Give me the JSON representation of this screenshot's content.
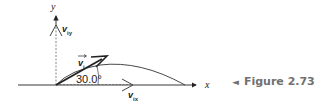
{
  "figure": {
    "caption_marker": "◄",
    "caption": "Figure 2.73"
  },
  "axes": {
    "x_label": "x",
    "y_label": "y"
  },
  "vectors": {
    "v_i": {
      "symbol": "v",
      "subscript": "i",
      "angle_label": "30.0°"
    },
    "v_ix": {
      "symbol": "v",
      "subscript": "ix"
    },
    "v_iy": {
      "symbol": "v",
      "subscript": "iy"
    }
  },
  "colors": {
    "line": "#222222",
    "dashed": "#555555",
    "caption": "#707070"
  }
}
